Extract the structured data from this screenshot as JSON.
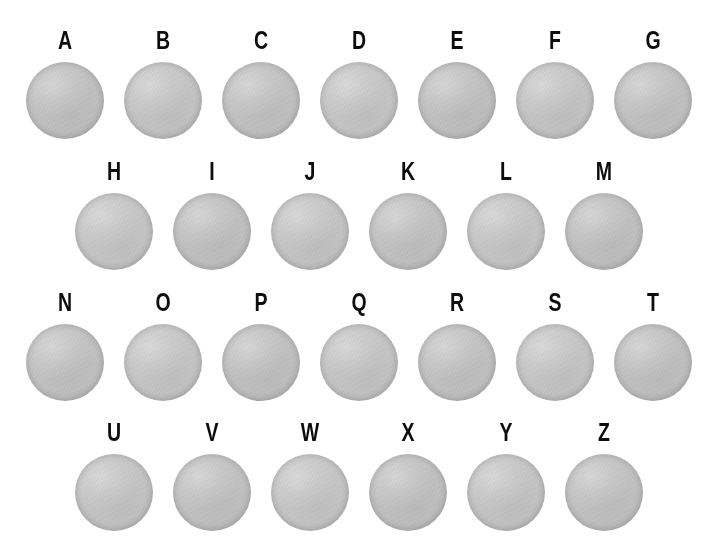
{
  "figure": {
    "background_color": "#ffffff",
    "disc_color": "#c7c7c7",
    "label_color": "#0d0d0d",
    "width": 706,
    "height": 551,
    "total_specimens": 26,
    "row_count": 4
  },
  "rows": [
    {
      "index": 0,
      "label_y": 28,
      "disc_y": 62,
      "x_start": 65,
      "x_step": 98,
      "count": 7,
      "items": [
        {
          "label": "A",
          "disc": "disc-a"
        },
        {
          "label": "B",
          "disc": "disc-b"
        },
        {
          "label": "C",
          "disc": "disc-c"
        },
        {
          "label": "D",
          "disc": "disc-d"
        },
        {
          "label": "E",
          "disc": "disc-e"
        },
        {
          "label": "F",
          "disc": "disc-f"
        },
        {
          "label": "G",
          "disc": "disc-g"
        }
      ]
    },
    {
      "index": 1,
      "label_y": 159,
      "disc_y": 193,
      "x_start": 114,
      "x_step": 98,
      "count": 6,
      "items": [
        {
          "label": "H",
          "disc": "disc-h"
        },
        {
          "label": "I",
          "disc": "disc-i"
        },
        {
          "label": "J",
          "disc": "disc-j"
        },
        {
          "label": "K",
          "disc": "disc-k"
        },
        {
          "label": "L",
          "disc": "disc-l"
        },
        {
          "label": "M",
          "disc": "disc-m"
        }
      ]
    },
    {
      "index": 2,
      "label_y": 290,
      "disc_y": 324,
      "x_start": 65,
      "x_step": 98,
      "count": 7,
      "items": [
        {
          "label": "N",
          "disc": "disc-n"
        },
        {
          "label": "O",
          "disc": "disc-o"
        },
        {
          "label": "P",
          "disc": "disc-p"
        },
        {
          "label": "Q",
          "disc": "disc-q"
        },
        {
          "label": "R",
          "disc": "disc-r"
        },
        {
          "label": "S",
          "disc": "disc-s"
        },
        {
          "label": "T",
          "disc": "disc-t"
        }
      ]
    },
    {
      "index": 3,
      "label_y": 420,
      "disc_y": 454,
      "x_start": 114,
      "x_step": 98,
      "count": 6,
      "items": [
        {
          "label": "U",
          "disc": "disc-u"
        },
        {
          "label": "V",
          "disc": "disc-v"
        },
        {
          "label": "W",
          "disc": "disc-w"
        },
        {
          "label": "X",
          "disc": "disc-x"
        },
        {
          "label": "Y",
          "disc": "disc-y"
        },
        {
          "label": "Z",
          "disc": "disc-z"
        }
      ]
    }
  ]
}
